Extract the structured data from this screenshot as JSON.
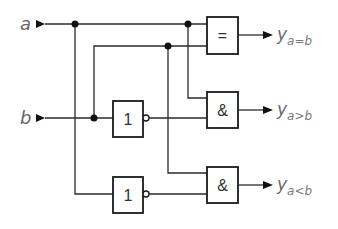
{
  "diagram": {
    "inputs": [
      {
        "id": "a",
        "label": "a"
      },
      {
        "id": "b",
        "label": "b"
      }
    ],
    "gates": [
      {
        "id": "xnor",
        "type": "equivalence",
        "label": "="
      },
      {
        "id": "not_b",
        "type": "NOT",
        "label": "1"
      },
      {
        "id": "and_gt",
        "type": "AND",
        "label": "&"
      },
      {
        "id": "not_a",
        "type": "NOT",
        "label": "1"
      },
      {
        "id": "and_lt",
        "type": "AND",
        "label": "&"
      }
    ],
    "outputs": [
      {
        "id": "eq",
        "main": "y",
        "sub": "a=b"
      },
      {
        "id": "gt",
        "main": "y",
        "sub": "a>b"
      },
      {
        "id": "lt",
        "main": "y",
        "sub": "a<b"
      }
    ],
    "colors": {
      "wire": "#2a2a2a",
      "label": "#666666"
    }
  }
}
